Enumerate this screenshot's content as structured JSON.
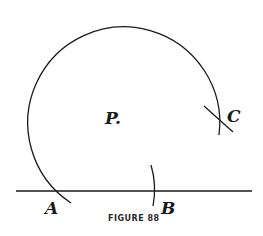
{
  "figure": {
    "caption": "FIGURE 88",
    "labels": {
      "P": "P.",
      "A": "A",
      "B": "B",
      "C": "C"
    }
  }
}
